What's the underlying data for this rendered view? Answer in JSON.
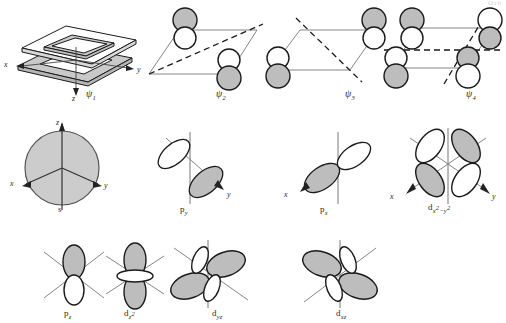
{
  "figure": {
    "title_fragment": "Orb",
    "background_color": "#ffffff",
    "lobe_fill_shaded": "#bdbdbd",
    "lobe_fill_empty": "#ffffff",
    "stroke_color": "#1a1a1a",
    "axis_color": "#555555"
  },
  "molecular_orbitals": [
    {
      "id": "psi1",
      "label": "ψ",
      "subscript": "1",
      "type": "box-frame-3d",
      "nodes": 0,
      "axes": [
        "x",
        "y",
        "z"
      ],
      "description": "nested 3D parallelogram frame, all lobes in phase"
    },
    {
      "id": "psi2",
      "label": "ψ",
      "subscript": "2",
      "type": "p-orbital-pairs",
      "nodes": 1,
      "node_style": [
        "diagonal-dashed"
      ],
      "lobes": [
        {
          "position": "upper-left",
          "top": "shaded",
          "bottom": "empty"
        },
        {
          "position": "lower-right",
          "top": "empty",
          "bottom": "shaded"
        }
      ]
    },
    {
      "id": "psi3",
      "label": "ψ",
      "subscript": "3",
      "type": "p-orbital-pairs",
      "nodes": 1,
      "node_style": [
        "diagonal-dashed"
      ],
      "lobes": [
        {
          "position": "lower-left",
          "top": "empty",
          "bottom": "shaded"
        },
        {
          "position": "upper-right",
          "top": "shaded",
          "bottom": "empty"
        }
      ]
    },
    {
      "id": "psi4",
      "label": "ψ",
      "subscript": "4",
      "type": "p-orbital-pairs",
      "nodes": 2,
      "node_style": [
        "horizontal-dashed",
        "diagonal-dashed"
      ],
      "lobes": [
        {
          "position": "upper-left",
          "top": "shaded",
          "bottom": "empty"
        },
        {
          "position": "upper-right",
          "top": "empty",
          "bottom": "shaded"
        },
        {
          "position": "lower-left",
          "top": "empty",
          "bottom": "shaded"
        },
        {
          "position": "lower-right",
          "top": "shaded",
          "bottom": "empty"
        }
      ]
    }
  ],
  "atomic_orbitals": [
    {
      "id": "s",
      "label": "s",
      "shape": "sphere",
      "fill": "shaded",
      "axes": [
        "x",
        "y",
        "z"
      ],
      "row": 2
    },
    {
      "id": "py",
      "label": "p",
      "subscript": "y",
      "shape": "two-lobe",
      "orientation": "diagonal-y",
      "axes": [
        "y"
      ],
      "lobes": [
        {
          "side": "upper-left",
          "fill": "empty"
        },
        {
          "side": "lower-right",
          "fill": "shaded"
        }
      ],
      "row": 2
    },
    {
      "id": "px",
      "label": "p",
      "subscript": "x",
      "shape": "two-lobe",
      "orientation": "diagonal-x",
      "axes": [
        "x"
      ],
      "lobes": [
        {
          "side": "lower-left",
          "fill": "shaded"
        },
        {
          "side": "upper-right",
          "fill": "empty"
        }
      ],
      "row": 2
    },
    {
      "id": "dx2y2",
      "label": "d",
      "subscript": "x²−y²",
      "shape": "four-lobe",
      "axes": [
        "x",
        "y"
      ],
      "lobes": [
        {
          "side": "upper-left",
          "fill": "empty"
        },
        {
          "side": "upper-right",
          "fill": "shaded"
        },
        {
          "side": "lower-left",
          "fill": "shaded"
        },
        {
          "side": "lower-right",
          "fill": "empty"
        }
      ],
      "row": 2
    },
    {
      "id": "pz",
      "label": "p",
      "subscript": "z",
      "shape": "two-lobe",
      "orientation": "vertical",
      "axes": [],
      "lobes": [
        {
          "side": "top",
          "fill": "shaded"
        },
        {
          "side": "bottom",
          "fill": "empty"
        }
      ],
      "row": 3
    },
    {
      "id": "dz2",
      "label": "d",
      "subscript": "z²",
      "shape": "two-lobe-with-torus",
      "orientation": "vertical",
      "axes": [],
      "lobes": [
        {
          "side": "top",
          "fill": "shaded"
        },
        {
          "side": "bottom",
          "fill": "shaded"
        },
        {
          "side": "torus",
          "fill": "empty"
        }
      ],
      "row": 3
    },
    {
      "id": "dyz",
      "label": "d",
      "subscript": "yz",
      "shape": "four-lobe",
      "axes": [],
      "lobes": [
        {
          "side": "upper-right",
          "fill": "shaded"
        },
        {
          "side": "lower-left",
          "fill": "shaded"
        },
        {
          "side": "upper-left",
          "fill": "empty"
        },
        {
          "side": "lower-right",
          "fill": "empty"
        }
      ],
      "row": 3
    },
    {
      "id": "dxz",
      "label": "d",
      "subscript": "xz",
      "shape": "four-lobe",
      "axes": [],
      "lobes": [
        {
          "side": "upper-left",
          "fill": "shaded"
        },
        {
          "side": "lower-right",
          "fill": "shaded"
        },
        {
          "side": "upper-right",
          "fill": "empty"
        },
        {
          "side": "lower-left",
          "fill": "empty"
        }
      ],
      "row": 3
    }
  ],
  "axis_labels": {
    "x": "x",
    "y": "y",
    "z": "z"
  }
}
